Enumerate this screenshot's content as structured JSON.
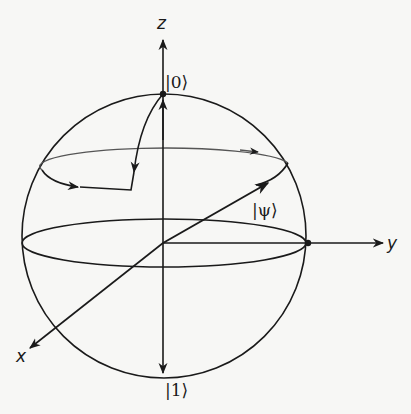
{
  "diagram": {
    "type": "bloch-sphere",
    "axes": {
      "z": "z",
      "y": "y",
      "x": "x"
    },
    "states": {
      "north": "|0⟩",
      "south": "|1⟩",
      "psi": "|ψ⟩"
    },
    "colors": {
      "stroke": "#1a1a1a",
      "background": "#f7f7f5"
    }
  }
}
